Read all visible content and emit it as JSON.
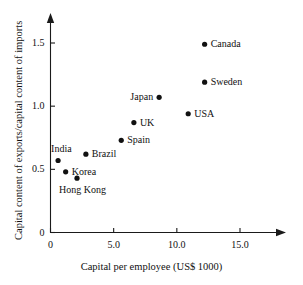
{
  "chart_data": {
    "type": "scatter",
    "title": "",
    "xlabel": "Capital per employee (US$ 1000)",
    "ylabel": "Capital content of exports/capital content of imports",
    "xlim": [
      0,
      17.5
    ],
    "ylim": [
      0,
      1.72
    ],
    "xticks": [
      "0",
      "5.0",
      "10.0",
      "15.0"
    ],
    "xtick_values": [
      0,
      5,
      10,
      15
    ],
    "yticks": [
      "0",
      "0.5",
      "1.0",
      "1.5"
    ],
    "ytick_values": [
      0,
      0.5,
      1.0,
      1.5
    ],
    "grid": false,
    "legend": "none",
    "points": [
      {
        "label": "India",
        "x": 0.6,
        "y": 0.57,
        "label_pos": "above-left"
      },
      {
        "label": "Korea",
        "x": 1.2,
        "y": 0.48,
        "label_pos": "right"
      },
      {
        "label": "Hong Kong",
        "x": 2.1,
        "y": 0.43,
        "label_pos": "below"
      },
      {
        "label": "Brazil",
        "x": 2.8,
        "y": 0.62,
        "label_pos": "right"
      },
      {
        "label": "Spain",
        "x": 5.6,
        "y": 0.73,
        "label_pos": "right"
      },
      {
        "label": "UK",
        "x": 6.6,
        "y": 0.87,
        "label_pos": "right"
      },
      {
        "label": "Japan",
        "x": 8.6,
        "y": 1.07,
        "label_pos": "left"
      },
      {
        "label": "USA",
        "x": 10.9,
        "y": 0.94,
        "label_pos": "right"
      },
      {
        "label": "Sweden",
        "x": 12.2,
        "y": 1.19,
        "label_pos": "right"
      },
      {
        "label": "Canada",
        "x": 12.2,
        "y": 1.49,
        "label_pos": "right"
      }
    ],
    "marker_color": "#111111",
    "axis_color": "#1a1a1a"
  }
}
